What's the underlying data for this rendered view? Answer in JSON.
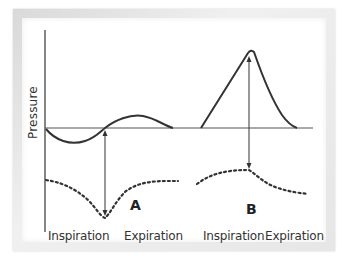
{
  "diagram": {
    "y_axis_label": "Pressure",
    "panels": [
      {
        "id": "A",
        "label": "A",
        "x_labels": [
          "Inspiration",
          "Expiration"
        ],
        "solid_curve": "dips below baseline during inspiration, rises above baseline during expiration",
        "dotted_curve": "sharp trough aligned with arrow during inspiration, then recovers"
      },
      {
        "id": "B",
        "label": "B",
        "x_labels": [
          "Inspiration",
          "Expiration"
        ],
        "solid_curve": "large positive peak above baseline during inspiration, decays during expiration",
        "dotted_curve": "gentle rise peaking under arrow during inspiration, then gradual fall"
      }
    ],
    "colors": {
      "line": "#333333",
      "baseline": "#555555",
      "frame": "#e2e2e2",
      "background": "#ffffff"
    }
  },
  "labels": {
    "pressure": "Pressure",
    "a": "A",
    "b": "B",
    "a_inspiration": "Inspiration",
    "a_expiration": "Expiration",
    "b_inspiration": "Inspiration",
    "b_expiration": "Expiration"
  }
}
